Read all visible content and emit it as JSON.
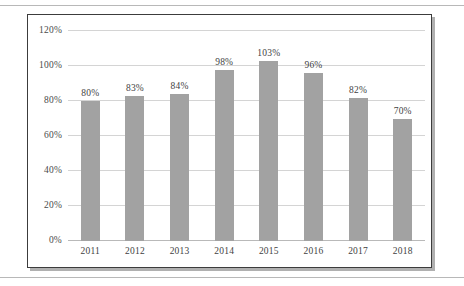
{
  "chart_data": {
    "type": "bar",
    "title": "",
    "subtitle": "",
    "xlabel": "",
    "ylabel": "",
    "categories": [
      "2011",
      "2012",
      "2013",
      "2014",
      "2015",
      "2016",
      "2017",
      "2018"
    ],
    "values": [
      80,
      83,
      84,
      98,
      103,
      96,
      82,
      70
    ],
    "data_labels": [
      "80%",
      "83%",
      "84%",
      "98%",
      "103%",
      "96%",
      "82%",
      "70%"
    ],
    "ylim": [
      0,
      120
    ],
    "ytick_values": [
      0,
      20,
      40,
      60,
      80,
      100,
      120
    ],
    "ytick_labels": [
      "0%",
      "20%",
      "40%",
      "60%",
      "80%",
      "100%",
      "120%"
    ],
    "grid": true,
    "grid_axis": "y",
    "legend": false,
    "legend_position": "none",
    "bar_color": "#a2a2a2",
    "gridline_color": "#d4d4d4",
    "axis_color": "#b9b9b9",
    "frame_color": "#3c3c3c",
    "background_color": "#ffffff",
    "label_color": "#3f3f3f"
  }
}
